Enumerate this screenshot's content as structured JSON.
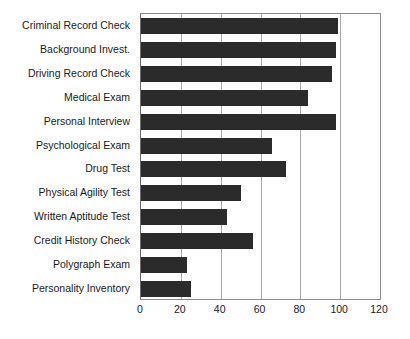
{
  "chart_data": {
    "type": "bar",
    "orientation": "horizontal",
    "title": "",
    "subtitle": "",
    "xlabel": "",
    "ylabel": "",
    "xlim": [
      0,
      120
    ],
    "xticks": [
      0,
      20,
      40,
      60,
      80,
      100,
      120
    ],
    "xtick_labels": [
      "0",
      "20",
      "40",
      "60",
      "80",
      "100",
      "120"
    ],
    "grid": true,
    "grid_axis": "x",
    "legend": false,
    "legend_position": "none",
    "bar_color": "#2b2b2b",
    "axis_color": "#8c8c8c",
    "gridline_color": "#a8a8a8",
    "categories": [
      "Criminal Record Check",
      "Background Invest.",
      "Driving Record Check",
      "Medical Exam",
      "Personal Interview",
      "Psychological Exam",
      "Drug Test",
      "Physical Agility Test",
      "Written Aptitude Test",
      "Credit History Check",
      "Polygraph Exam",
      "Personality Inventory"
    ],
    "values": [
      99,
      98,
      96,
      84,
      98,
      66,
      73,
      50,
      43,
      56,
      23,
      25
    ]
  }
}
